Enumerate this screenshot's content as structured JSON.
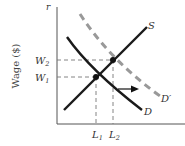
{
  "diagram": {
    "type": "supply-demand",
    "y_axis": {
      "title": "Wage ($)",
      "top_label": "r"
    },
    "x_axis": {
      "title": ""
    },
    "tick_labels": {
      "w2_base": "W",
      "w2_sub": "2",
      "w1_base": "W",
      "w1_sub": "1",
      "l1_base": "L",
      "l1_sub": "1",
      "l2_base": "L",
      "l2_sub": "2"
    },
    "curves": {
      "supply_label": "S",
      "demand_label": "D",
      "new_demand_label": "D′"
    },
    "shift_arrow": "right",
    "colors": {
      "solid": "#1a1a1a",
      "dashed_curve": "#999999",
      "guides": "#777777",
      "axis": "#555555"
    }
  }
}
